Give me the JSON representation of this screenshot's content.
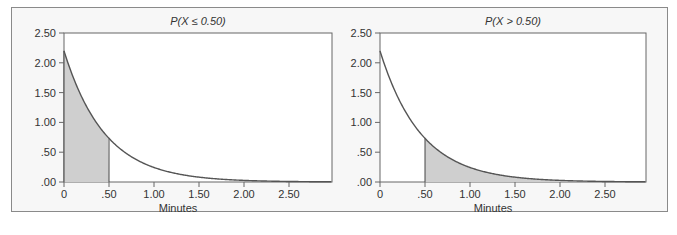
{
  "chart_data": [
    {
      "type": "area",
      "title": "P(X ≤ 0.50)",
      "xlabel": "Minutes",
      "ylabel": "",
      "x_ticks": [
        "0",
        ".50",
        "1.00",
        "1.50",
        "2.00",
        "2.50"
      ],
      "y_ticks": [
        ".00",
        ".50",
        "1.00",
        "1.50",
        "2.00",
        "2.50"
      ],
      "xlim": [
        0,
        3.0
      ],
      "ylim": [
        0,
        2.5
      ],
      "grid": false,
      "curve": {
        "function": "exponential density",
        "lambda": 2.2,
        "f0": 2.2
      },
      "x": [
        0,
        0.25,
        0.5,
        0.75,
        1.0,
        1.5,
        2.0,
        2.5,
        3.0
      ],
      "values": [
        2.2,
        1.27,
        0.73,
        0.42,
        0.24,
        0.08,
        0.03,
        0.01,
        0.0
      ],
      "shaded_region": {
        "from": 0,
        "to": 0.5,
        "label": "P(X ≤ 0.50)"
      }
    },
    {
      "type": "area",
      "title": "P(X > 0.50)",
      "xlabel": "Minutes",
      "ylabel": "",
      "x_ticks": [
        "0",
        ".50",
        "1.00",
        "1.50",
        "2.00",
        "2.50"
      ],
      "y_ticks": [
        ".00",
        ".50",
        "1.00",
        "1.50",
        "2.00",
        "2.50"
      ],
      "xlim": [
        0,
        3.0
      ],
      "ylim": [
        0,
        2.5
      ],
      "grid": false,
      "curve": {
        "function": "exponential density",
        "lambda": 2.2,
        "f0": 2.2
      },
      "x": [
        0,
        0.25,
        0.5,
        0.75,
        1.0,
        1.5,
        2.0,
        2.5,
        3.0
      ],
      "values": [
        2.2,
        1.27,
        0.73,
        0.42,
        0.24,
        0.08,
        0.03,
        0.01,
        0.0
      ],
      "shaded_region": {
        "from": 0.5,
        "to": 3.0,
        "label": "P(X > 0.50)"
      }
    }
  ],
  "colors": {
    "shade": "#cfcfcf",
    "curve": "#555555",
    "axis": "#666666",
    "frame_bg": "#f7f7f7",
    "plot_bg": "#ffffff"
  }
}
